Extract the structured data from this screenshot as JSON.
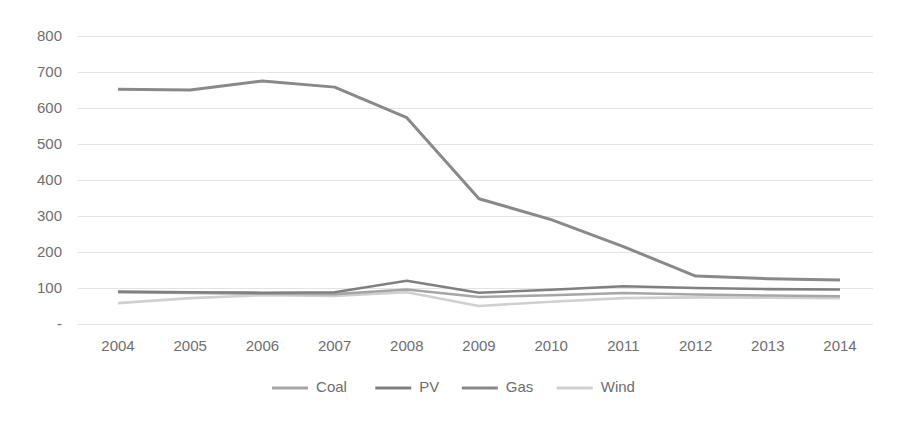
{
  "chart_data": {
    "type": "line",
    "title": "",
    "subtitle": "",
    "xlabel": "",
    "ylabel": "",
    "categories": [
      "2004",
      "2005",
      "2006",
      "2007",
      "2008",
      "2009",
      "2010",
      "2011",
      "2012",
      "2013",
      "2014"
    ],
    "x": [
      2004,
      2005,
      2006,
      2007,
      2008,
      2009,
      2010,
      2011,
      2012,
      2013,
      2014
    ],
    "ylim": [
      0,
      800
    ],
    "xlim": [
      2004,
      2014
    ],
    "y_ticks": [
      "-",
      "100",
      "200",
      "300",
      "400",
      "500",
      "600",
      "700",
      "800"
    ],
    "y_tick_values": [
      0,
      100,
      200,
      300,
      400,
      500,
      600,
      700,
      800
    ],
    "grid": true,
    "grid_axis": "y",
    "legend_position": "bottom",
    "series": [
      {
        "name": "Coal",
        "color": "#a6a6a6",
        "values": [
          88,
          86,
          84,
          83,
          96,
          75,
          80,
          86,
          82,
          79,
          77
        ]
      },
      {
        "name": "PV",
        "color": "#808080",
        "values": [
          90,
          88,
          87,
          88,
          120,
          87,
          95,
          105,
          100,
          97,
          96
        ]
      },
      {
        "name": "Gas",
        "color": "#898989",
        "values": [
          652,
          650,
          675,
          658,
          573,
          348,
          290,
          215,
          133,
          126,
          122
        ]
      },
      {
        "name": "Wind",
        "color": "#d0d0d0",
        "values": [
          58,
          72,
          80,
          78,
          88,
          50,
          62,
          72,
          74,
          73,
          72
        ]
      }
    ]
  },
  "legend": {
    "items": [
      {
        "label": "Coal",
        "color": "#a6a6a6"
      },
      {
        "label": "PV",
        "color": "#808080"
      },
      {
        "label": "Gas",
        "color": "#898989"
      },
      {
        "label": "Wind",
        "color": "#d0d0d0"
      }
    ]
  },
  "axes": {
    "y_labels": [
      "800",
      "700",
      "600",
      "500",
      "400",
      "300",
      "200",
      "100",
      "-"
    ],
    "x_labels": [
      "2004",
      "2005",
      "2006",
      "2007",
      "2008",
      "2009",
      "2010",
      "2011",
      "2012",
      "2013",
      "2014"
    ]
  },
  "colors": {
    "gridline": "#e3e3e3",
    "text": "#6e6e6e",
    "background": "#ffffff"
  }
}
